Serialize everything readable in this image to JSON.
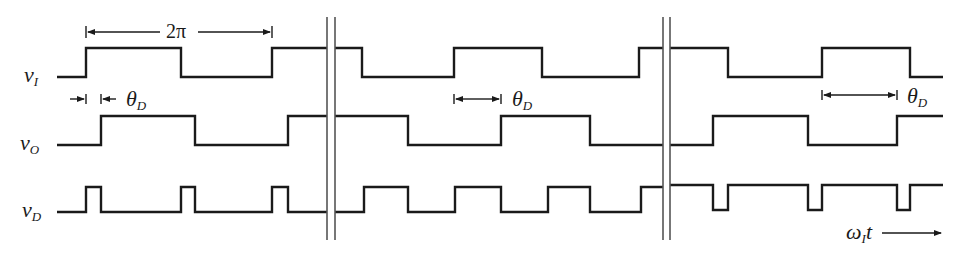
{
  "signals": [
    {
      "id": "vI",
      "label_main": "v",
      "label_sub": "I"
    },
    {
      "id": "vO",
      "label_main": "v",
      "label_sub": "O"
    },
    {
      "id": "vD",
      "label_main": "v",
      "label_sub": "D"
    }
  ],
  "annotations": {
    "period": "2π",
    "delay_main": "θ",
    "delay_sub": "D",
    "axis_main": "ω",
    "axis_sub": "I",
    "axis_var": "t"
  },
  "stroke_color": "#1a1a1a",
  "breaks": [
    [
      327,
      335
    ],
    [
      663,
      670
    ]
  ],
  "waveforms": {
    "vI": "M 57 77 H 86 V 48 H 181 V 77 H 272 V 48 H 327 M 335 48 H 362 V 77 H 454 V 48 H 542 V 77 H 639 V 48 H 663 M 670 48 H 728 V 77 H 822 V 48 H 910 V 77 H 943",
    "vO": "M 57 145 H 101 V 116 H 195 V 145 H 288 V 116 H 327 M 335 116 H 408 V 145 H 501 V 116 H 590 V 145 H 663 M 670 145 H 713 V 116 H 808 V 145 H 897 V 116 H 943",
    "vD": "M 57 212 H 86 V 187 H 101 V 212 H 181 V 187 H 195 V 212 H 272 V 187 H 288 V 212 H 327 M 335 212 H 364 V 187 H 408 V 212 H 455 V 187 H 501 V 212 H 548 V 187 H 590 V 212 H 641 V 187 H 663 M 670 185 H 713 V 210 H 728 V 185 H 808 V 210 H 822 V 185 H 897 V 210 H 910 V 185 H 943"
  }
}
